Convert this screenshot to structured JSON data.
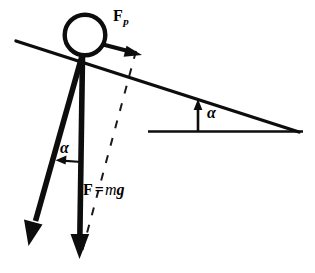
{
  "figure": {
    "background_color": "#ffffff",
    "stroke_color": "#0d0d0d",
    "labels": {
      "force_parallel": "F",
      "force_parallel_subscript": "p",
      "angle_incline": "α",
      "angle_weight": "α",
      "weight_symbol": "F",
      "weight_equals": "=",
      "weight_mass": "m",
      "weight_gravity": "g"
    },
    "elements": {
      "ball": {
        "name": "ball",
        "cx": 85,
        "cy": 35,
        "r": 20.5,
        "stroke_width": 4.2,
        "fill": "#ffffff"
      },
      "incline_line": {
        "name": "incline-surface",
        "x1": 16,
        "y1": 41,
        "x2": 299,
        "y2": 132,
        "stroke_width": 3.4
      },
      "baseline": {
        "name": "horizontal-baseline",
        "x1": 148,
        "y1": 131,
        "x2": 303,
        "y2": 131,
        "stroke_width": 2.4
      },
      "angle_arrow_right": {
        "name": "incline-angle-arrow",
        "x1": 198,
        "y1": 131,
        "x2": 198,
        "y2": 101,
        "stroke_width": 2.6
      },
      "force_parallel_arrow": {
        "name": "force-parallel-arrow",
        "x1": 103,
        "y1": 44,
        "x2": 141,
        "y2": 54,
        "stroke_width": 4.0
      },
      "weight_arrow": {
        "name": "weight-force-arrow",
        "x1": 82,
        "y1": 56,
        "x2": 79,
        "y2": 252,
        "stroke_width": 5.6
      },
      "normal_component_arrow": {
        "name": "perpendicular-component-arrow",
        "x1": 82,
        "y1": 56,
        "x2": 30,
        "y2": 240,
        "stroke_width": 5.6
      },
      "dashed_line": {
        "name": "perpendicular-dashed-line",
        "x1": 136,
        "y1": 52,
        "x2": 80,
        "y2": 258,
        "stroke_width": 2.0,
        "dash": "8 9"
      },
      "angle_arrow_left": {
        "name": "weight-angle-arrow",
        "x1": 81,
        "y1": 162,
        "x2": 56,
        "y2": 160,
        "stroke_width": 2.2
      }
    }
  }
}
